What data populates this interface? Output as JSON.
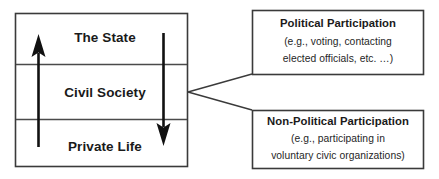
{
  "diagram": {
    "main_box": {
      "name": "society-spheres-box",
      "tiers": [
        {
          "id": "state",
          "label": "The State"
        },
        {
          "id": "civil-society",
          "label": "Civil Society"
        },
        {
          "id": "private-life",
          "label": "Private Life"
        }
      ]
    },
    "arrows": [
      {
        "id": "upward-arrow",
        "direction": "up",
        "from": "Private Life",
        "to": "The State"
      },
      {
        "id": "downward-arrow",
        "direction": "down",
        "from": "The State",
        "to": "Private Life"
      }
    ],
    "callouts": [
      {
        "id": "political-participation",
        "title": "Political Participation",
        "lines": [
          "(e.g., voting, contacting",
          "elected officials, etc. …)"
        ]
      },
      {
        "id": "non-political-participation",
        "title": "Non-Political Participation",
        "lines": [
          "(e.g., participating in",
          "voluntary civic organizations)"
        ]
      }
    ],
    "connector": {
      "id": "civil-society-branch-connector",
      "source": "Civil Society"
    },
    "colors": {
      "background": "#ffffff",
      "box_stroke": "#3a3a3a",
      "divider": "#4a4a4a",
      "arrow": "#111111",
      "text": "#1a1a1a",
      "subtext": "#262626"
    }
  }
}
